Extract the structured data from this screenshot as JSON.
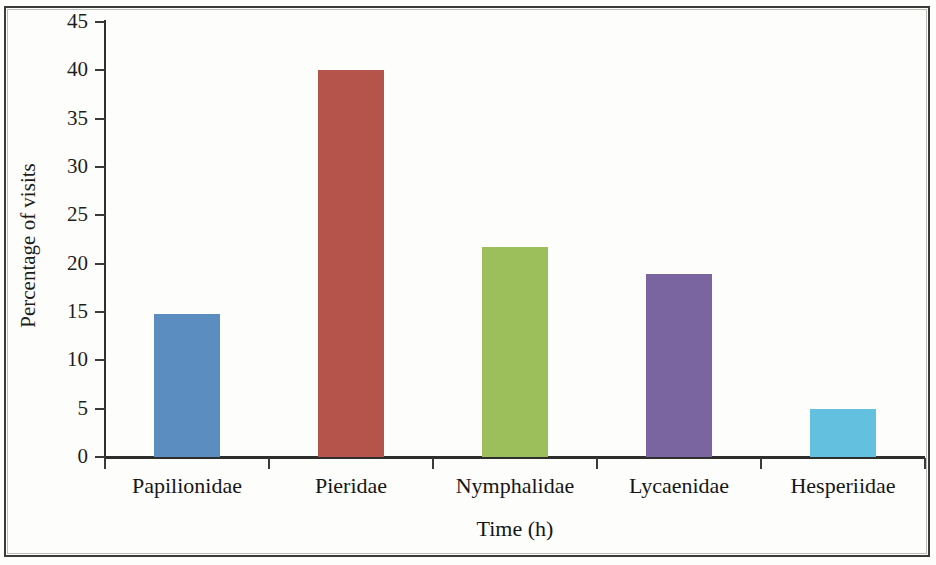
{
  "chart_data": {
    "type": "bar",
    "title": "",
    "xlabel": "Time (h)",
    "ylabel": "Percentage of visits",
    "categories": [
      "Papilionidae",
      "Pieridae",
      "Nymphalidae",
      "Lycaenidae",
      "Hesperiidae"
    ],
    "values": [
      14.8,
      40.0,
      21.7,
      18.9,
      5.0
    ],
    "colors": [
      "#5B8DC0",
      "#B5544A",
      "#9DBF5B",
      "#7A65A0",
      "#63C0DF"
    ],
    "ylim": [
      0,
      45
    ],
    "yticks": [
      0,
      5,
      10,
      15,
      20,
      25,
      30,
      35,
      40,
      45
    ],
    "ytick_labels": [
      "0",
      "5",
      "10",
      "15",
      "20",
      "25",
      "30",
      "35",
      "40",
      "45"
    ],
    "grid": false,
    "legend": false,
    "legend_position": "none",
    "bar_width_fraction": 0.4
  },
  "figure": {
    "background_color": "#fdfdfc",
    "border_color": "#3a3a38",
    "axis_color": "#2e2e2c",
    "text_color": "#161614"
  }
}
